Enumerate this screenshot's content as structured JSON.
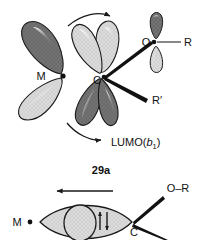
{
  "figure": {
    "number_label": "29a",
    "orbital_label_prefix": "LUMO(",
    "orbital_label_symbol": "b",
    "orbital_label_subscript": "1",
    "orbital_label_suffix": ")"
  },
  "top_diagram": {
    "name": "metal-carbene-lumo-orbital-diagram",
    "atoms": {
      "metal": "M",
      "carbon": "C",
      "oxygen": "O",
      "substituent_r": "R",
      "substituent_r_prime": "R′"
    },
    "rotation_arrows": {
      "top": "clockwise-rotation-arrow",
      "bottom": "clockwise-rotation-arrow"
    },
    "lobes": [
      {
        "id": "metal-lobe-upper-left",
        "shade": "dark"
      },
      {
        "id": "metal-lobe-lower-left",
        "shade": "light"
      },
      {
        "id": "carbene-lobe-upper-inner",
        "shade": "light"
      },
      {
        "id": "carbene-lobe-upper-outer",
        "shade": "light"
      },
      {
        "id": "carbene-lobe-lower-inner",
        "shade": "dark"
      },
      {
        "id": "carbene-lobe-lower-outer",
        "shade": "dark"
      },
      {
        "id": "oxygen-p-lobe-upper",
        "shade": "dark"
      },
      {
        "id": "oxygen-p-lobe-lower",
        "shade": "light"
      }
    ]
  },
  "bottom_diagram": {
    "name": "metal-carbene-pi-bond-diagram",
    "atoms": {
      "metal": "M",
      "carbon": "C",
      "alkoxy": "O–R"
    },
    "electron_pair": "up-down-spin-arrows",
    "translation_arrow": "leftward-arrow"
  },
  "colors": {
    "dark_lobe": "#6e6e6e",
    "light_lobe": "#d8d8d8",
    "outline": "#1a1a1a",
    "bond": "#111111",
    "thin_bond": "#6a6a6a",
    "text": "#111111"
  }
}
